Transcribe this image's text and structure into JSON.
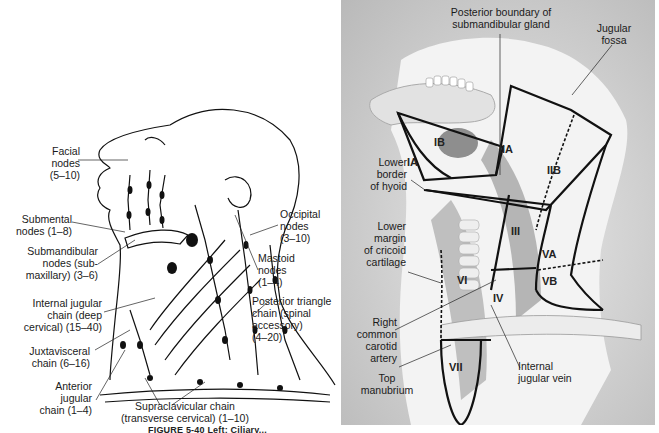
{
  "figure": {
    "caption_fragment": "FIGURE 5-40  Left: Ciliary..."
  },
  "left_panel": {
    "title": "Lymph node groups of head and neck",
    "labels": [
      {
        "id": "facial",
        "text": "Facial\nnodes\n(5–10)"
      },
      {
        "id": "submental",
        "text": "Submental\nnodes (1–8)"
      },
      {
        "id": "submandibular",
        "text": "Submandibular\nnodes (sub-\nmaxillary) (3–6)"
      },
      {
        "id": "internal-jugular",
        "text": "Internal jugular\nchain (deep\ncervical) (15–40)"
      },
      {
        "id": "juxtavisceral",
        "text": "Juxtavisceral\nchain (6–16)"
      },
      {
        "id": "anterior-jugular",
        "text": "Anterior\njugular\nchain (1–4)"
      },
      {
        "id": "supraclavicular",
        "text": "Supraclavicular chain\n(transverse cervical) (1–10)"
      },
      {
        "id": "occipital",
        "text": "Occipital\nnodes\n(3–10)"
      },
      {
        "id": "mastoid",
        "text": "Mastoid\nnodes\n(1–4)"
      },
      {
        "id": "posterior-triangle",
        "text": "Posterior triangle\nchain (spinal\naccessory)\n(4–20)"
      }
    ]
  },
  "right_panel": {
    "title": "Neck lymph node levels",
    "labels": [
      {
        "id": "posterior-boundary",
        "text": "Posterior boundary of\nsubmandibular gland"
      },
      {
        "id": "jugular-fossa",
        "text": "Jugular\nfossa"
      },
      {
        "id": "lower-border-hyoid",
        "text": "Lower\nborder\nof hyoid"
      },
      {
        "id": "lower-margin-cricoid",
        "text": "Lower\nmargin\nof cricoid\ncartilage"
      },
      {
        "id": "right-common-carotid",
        "text": "Right\ncommon\ncarotid\nartery"
      },
      {
        "id": "top-manubrium",
        "text": "Top\nmanubrium"
      },
      {
        "id": "internal-jugular-vein",
        "text": "Internal\njugular vein"
      }
    ],
    "zones": [
      "IA",
      "IB",
      "IIA",
      "IIB",
      "III",
      "IV",
      "VA",
      "VB",
      "VI",
      "VII"
    ]
  },
  "colors": {
    "panel_bg": "#c8c8c8",
    "line": "#111111",
    "tissue": "#9a9a9a"
  }
}
